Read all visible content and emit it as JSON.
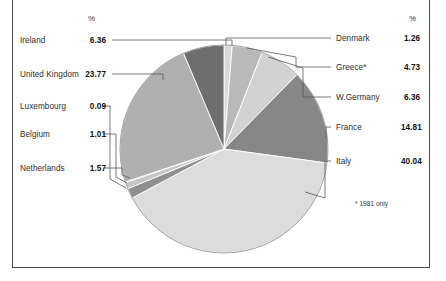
{
  "figure": {
    "left_header": "%",
    "right_header": "%",
    "footnote": "* 1981 only"
  },
  "left_labels": [
    {
      "name": "Ireland",
      "value": "6.36"
    },
    {
      "name": "United Kingdom",
      "value": "23.77"
    },
    {
      "name": "Luxembourg",
      "value": "0.09"
    },
    {
      "name": "Belgium",
      "value": "1.01"
    },
    {
      "name": "Netherlands",
      "value": "1.57"
    }
  ],
  "right_labels": [
    {
      "name": "Denmark",
      "value": "1.26"
    },
    {
      "name": "Greece*",
      "value": "4.73"
    },
    {
      "name": "W.Germany",
      "value": "6.36"
    },
    {
      "name": "France",
      "value": "14.81"
    },
    {
      "name": "Italy",
      "value": "40.04"
    }
  ],
  "chart_data": {
    "type": "pie",
    "title": "",
    "xlabel": "",
    "ylabel": "",
    "unit": "%",
    "start_angle_deg": 0,
    "direction": "clockwise",
    "center_px": [
      224,
      149
    ],
    "radius_px": 104,
    "legend_position": "leader-lines both sides",
    "grid": false,
    "total": 99.64,
    "categories": [
      "Denmark",
      "Greece*",
      "W.Germany",
      "France",
      "Italy",
      "Netherlands",
      "Belgium",
      "Luxembourg",
      "United Kingdom",
      "Ireland"
    ],
    "values": [
      1.26,
      4.73,
      6.36,
      14.81,
      40.04,
      1.57,
      1.01,
      0.09,
      23.77,
      6.36
    ],
    "colors": [
      "#d9d9d9",
      "#b9b9b9",
      "#d2d2d2",
      "#878787",
      "#dcdcdc",
      "#8f8f8f",
      "#c6c6c6",
      "#6f6f6f",
      "#b0b0b0",
      "#6e6e6e"
    ],
    "slices": [
      {
        "label": "Denmark",
        "value": 1.26,
        "color": "#d9d9d9"
      },
      {
        "label": "Greece*",
        "value": 4.73,
        "color": "#b9b9b9"
      },
      {
        "label": "W.Germany",
        "value": 6.36,
        "color": "#d2d2d2"
      },
      {
        "label": "France",
        "value": 14.81,
        "color": "#878787"
      },
      {
        "label": "Italy",
        "value": 40.04,
        "color": "#dcdcdc"
      },
      {
        "label": "Netherlands",
        "value": 1.57,
        "color": "#8f8f8f"
      },
      {
        "label": "Belgium",
        "value": 1.01,
        "color": "#c6c6c6"
      },
      {
        "label": "Luxembourg",
        "value": 0.09,
        "color": "#6f6f6f"
      },
      {
        "label": "United Kingdom",
        "value": 23.77,
        "color": "#b0b0b0"
      },
      {
        "label": "Ireland",
        "value": 6.36,
        "color": "#6e6e6e"
      }
    ]
  }
}
